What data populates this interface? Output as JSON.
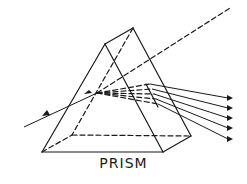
{
  "diagram": {
    "caption": "PRISM",
    "elements": {
      "incoming_ray": "single ray entering the prism from left with direction arrow",
      "undeviated_path": "dashed line continuing toward upper right",
      "internal_rays": "dashed fan of rays inside the prism",
      "outgoing_rays": 5,
      "arrowheads": 5
    },
    "colors": {
      "line": "#1a1a1a",
      "background": "#ffffff"
    }
  }
}
